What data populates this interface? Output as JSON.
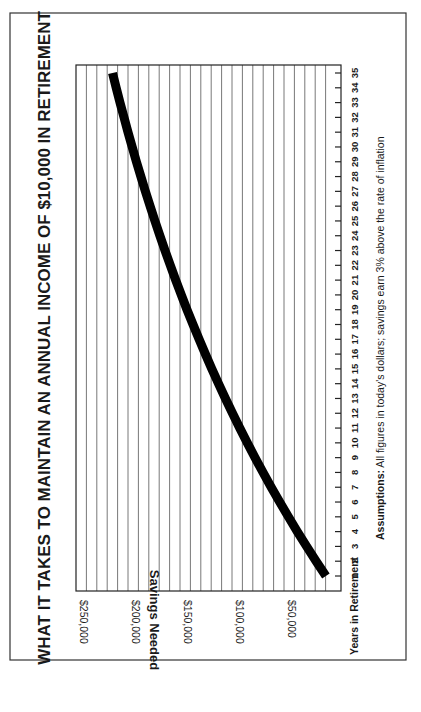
{
  "chart_data": {
    "type": "line",
    "orientation": "rotated 90deg counterclockwise on page",
    "title": "WHAT IT TAKES TO MAINTAIN AN ANNUAL INCOME OF $10,000 IN RETIREMENT",
    "xlabel": "Years in Retirement",
    "ylabel": "Savings Needed",
    "footnote_bold": "Assumptions:",
    "footnote_text": "All figures in today's dollars; savings earn 3% above the rate of inflation",
    "x": [
      1,
      2,
      3,
      4,
      5,
      6,
      7,
      8,
      9,
      10,
      11,
      12,
      13,
      14,
      15,
      16,
      17,
      18,
      19,
      20,
      21,
      22,
      23,
      24,
      25,
      26,
      27,
      28,
      29,
      30,
      31,
      32,
      33,
      34,
      35
    ],
    "series": [
      {
        "name": "Savings Needed",
        "values": [
          9709,
          19135,
          28286,
          37171,
          45797,
          54172,
          62303,
          70197,
          77861,
          85302,
          92526,
          99540,
          106350,
          112961,
          119379,
          125611,
          131661,
          137535,
          143238,
          148775,
          154150,
          159369,
          164436,
          169355,
          174131,
          178768,
          183270,
          187641,
          191885,
          196004,
          200004,
          203888,
          207658,
          211318,
          214872
        ]
      }
    ],
    "yticks": [
      "$50,000",
      "$100,000",
      "$150,000",
      "$200,000",
      "$250,000"
    ],
    "ytick_values": [
      50000,
      100000,
      150000,
      200000,
      250000
    ],
    "xticks": [
      "1",
      "2",
      "3",
      "4",
      "5",
      "6",
      "7",
      "8",
      "9",
      "10",
      "11",
      "12",
      "13",
      "14",
      "15",
      "16",
      "17",
      "18",
      "19",
      "20",
      "21",
      "22",
      "23",
      "24",
      "25",
      "26",
      "27",
      "28",
      "29",
      "30",
      "31",
      "32",
      "33",
      "34",
      "35"
    ],
    "ylim": [
      0,
      255000
    ],
    "xlim": [
      1,
      35
    ],
    "grid": "value gridlines every $10,000",
    "legend": "none",
    "line_color": "#000000"
  }
}
